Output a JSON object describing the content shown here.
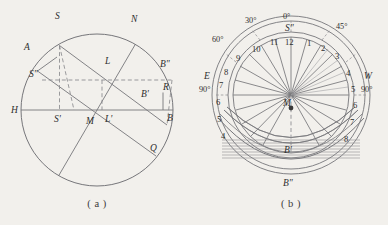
{
  "figure": {
    "background_color": "#f2f0ec",
    "ink_color": "#6e6e70",
    "text_color": "#2e2e2e"
  },
  "panel_a": {
    "caption": "( a )",
    "labels": {
      "S": "S",
      "N": "N",
      "A": "A",
      "L": "L",
      "Bpp": "B\"",
      "Spp": "S\"",
      "R": "R",
      "Bp": "B'",
      "H": "H",
      "Sp": "S'",
      "M": "M",
      "Lp": "L'",
      "B": "B",
      "Q": "Q"
    }
  },
  "panel_b": {
    "caption": "( b )",
    "labels": {
      "Spp": "S\"",
      "Bp": "B'",
      "Bpp": "B\"",
      "M": "M",
      "E": "E",
      "W": "W"
    },
    "degrees": {
      "top": "0°",
      "thirty": "30°",
      "fortyfive": "45°",
      "sixty": "60°",
      "east_ninety": "90°",
      "west_ninety": "90°"
    },
    "hours_left": [
      "11",
      "10",
      "9",
      "8",
      "7",
      "6",
      "5",
      "4"
    ],
    "hours_center": [
      "12"
    ],
    "hours_right": [
      "1",
      "2",
      "3",
      "4",
      "5",
      "6",
      "7",
      "8"
    ]
  }
}
